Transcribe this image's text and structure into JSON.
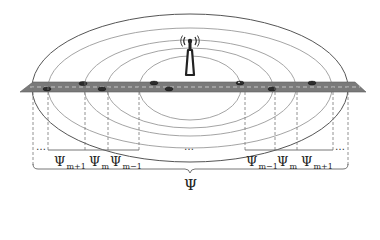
{
  "figure": {
    "colors": {
      "road": "#7a7a7a",
      "road_edge": "#5e5e5e",
      "lane_marking": "#e8e8e8",
      "ring_outer": "#555555",
      "ring_inner": "#9a9a9a",
      "dashed": "#777777",
      "vehicle": "#2b2b2b",
      "text": "#222222"
    },
    "icons": {
      "tower": "cell-tower-icon",
      "vehicle": "car-icon"
    }
  },
  "labels": {
    "left": [
      {
        "base": "Ψ",
        "sub": "m+1"
      },
      {
        "base": "Ψ",
        "sub": "m"
      },
      {
        "base": "Ψ",
        "sub": "m−1"
      }
    ],
    "right": [
      {
        "base": "Ψ",
        "sub": "m−1"
      },
      {
        "base": "Ψ",
        "sub": "m"
      },
      {
        "base": "Ψ",
        "sub": "m+1"
      }
    ],
    "ellipsis_left": "…",
    "ellipsis_center": "…",
    "ellipsis_right": "…",
    "total": "Ψ"
  }
}
